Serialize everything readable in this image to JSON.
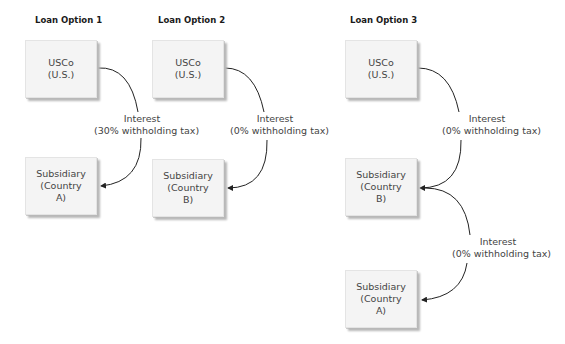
{
  "headings": [
    {
      "text": "Loan Option 1"
    },
    {
      "text": "Loan Option 2"
    },
    {
      "text": "Loan Option 3"
    }
  ],
  "boxes": {
    "opt1_parent": {
      "line1": "USCo",
      "line2": "(U.S.)"
    },
    "opt1_sub": {
      "line1": "Subsidiary",
      "line2": "(Country",
      "line3": "A)"
    },
    "opt2_parent": {
      "line1": "USCo",
      "line2": "(U.S.)"
    },
    "opt2_sub": {
      "line1": "Subsidiary",
      "line2": "(Country",
      "line3": "B)"
    },
    "opt3_parent": {
      "line1": "USCo",
      "line2": "(U.S.)"
    },
    "opt3_sub_b": {
      "line1": "Subsidiary",
      "line2": "(Country",
      "line3": "B)"
    },
    "opt3_sub_a": {
      "line1": "Subsidiary",
      "line2": "(Country",
      "line3": "A)"
    }
  },
  "flows": [
    {
      "line1": "Interest",
      "line2": "(30% withholding tax)"
    },
    {
      "line1": "Interest",
      "line2": "(0% withholding tax)"
    },
    {
      "line1": "Interest",
      "line2": "(0% withholding tax)"
    },
    {
      "line1": "Interest",
      "line2": "(0% withholding tax)"
    }
  ],
  "colors": {
    "box_fill": "#f4f4f4",
    "shadow": "#b8b8b8",
    "line": "#222222",
    "text": "#444444"
  }
}
